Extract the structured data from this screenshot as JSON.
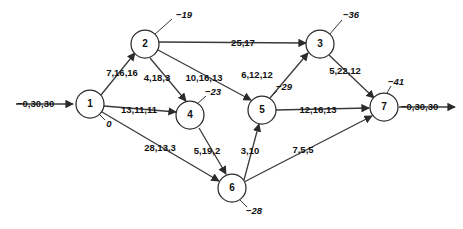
{
  "diagram": {
    "type": "network-flow-graph",
    "colors": {
      "stroke": "#3a3a3a",
      "node_stroke": "#2b2b2b",
      "text": "#111111",
      "background": "#ffffff"
    },
    "nodes": [
      {
        "id": "1",
        "label": "1",
        "supply": "0",
        "cx": 90,
        "cy": 104,
        "r": 14,
        "supply_x": 109,
        "supply_y": 124,
        "leader": [
          99,
          114,
          105,
          120
        ]
      },
      {
        "id": "2",
        "label": "2",
        "supply": "−19",
        "cx": 145,
        "cy": 44,
        "r": 14,
        "supply_x": 184,
        "supply_y": 15,
        "leader": [
          154,
          35,
          172,
          19
        ]
      },
      {
        "id": "3",
        "label": "3",
        "supply": "−36",
        "cx": 320,
        "cy": 44,
        "r": 14,
        "supply_x": 351,
        "supply_y": 15,
        "leader": [
          329,
          35,
          342,
          20
        ]
      },
      {
        "id": "4",
        "label": "4",
        "supply": "−23",
        "cx": 190,
        "cy": 115,
        "r": 14,
        "supply_x": 213,
        "supply_y": 92,
        "leader": [
          197,
          104,
          206,
          96
        ]
      },
      {
        "id": "5",
        "label": "5",
        "supply": "−29",
        "cx": 262,
        "cy": 110,
        "r": 14,
        "supply_x": 284,
        "supply_y": 87,
        "leader": [
          269,
          99,
          277,
          91
        ]
      },
      {
        "id": "6",
        "label": "6",
        "supply": "−28",
        "cx": 232,
        "cy": 188,
        "r": 14,
        "supply_x": 254,
        "supply_y": 211,
        "leader": [
          239,
          199,
          247,
          207
        ]
      },
      {
        "id": "7",
        "label": "7",
        "supply": "−41",
        "cx": 384,
        "cy": 107,
        "r": 14,
        "supply_x": 396,
        "supply_y": 82,
        "leader": [
          387,
          93,
          391,
          86
        ]
      }
    ],
    "edges": [
      {
        "from": "1",
        "to": "2",
        "label": "7,16,16",
        "lx": 122,
        "ly": 73,
        "x1": 101,
        "y1": 95,
        "x2": 135,
        "y2": 53
      },
      {
        "from": "1",
        "to": "4",
        "label": "13,11,11",
        "lx": 139,
        "ly": 110,
        "x1": 104,
        "y1": 106,
        "x2": 176,
        "y2": 112
      },
      {
        "from": "1",
        "to": "6",
        "label": "28,13,3",
        "lx": 160,
        "ly": 148,
        "x1": 102,
        "y1": 112,
        "x2": 219,
        "y2": 181
      },
      {
        "from": "2",
        "to": "3",
        "label": "25,17",
        "lx": 243,
        "ly": 43,
        "x1": 159,
        "y1": 42,
        "x2": 306,
        "y2": 43
      },
      {
        "from": "2",
        "to": "4",
        "label": "4,18,3",
        "lx": 157,
        "ly": 78,
        "x1": 150,
        "y1": 58,
        "x2": 186,
        "y2": 101
      },
      {
        "from": "2",
        "to": "5",
        "label": "10,16,13",
        "lx": 204,
        "ly": 78,
        "x1": 158,
        "y1": 50,
        "x2": 251,
        "y2": 100
      },
      {
        "from": "5",
        "to": "3",
        "label": "6,12,12",
        "lx": 257,
        "ly": 75,
        "x1": 270,
        "y1": 98,
        "x2": 308,
        "y2": 53
      },
      {
        "from": "3",
        "to": "7",
        "label": "5,22,12",
        "lx": 345,
        "ly": 71,
        "x1": 329,
        "y1": 55,
        "x2": 374,
        "y2": 98
      },
      {
        "from": "5",
        "to": "7",
        "label": "12,16,13",
        "lx": 318,
        "ly": 110,
        "x1": 276,
        "y1": 110,
        "x2": 369,
        "y2": 108
      },
      {
        "from": "4",
        "to": "6",
        "label": "5,19,2",
        "lx": 207,
        "ly": 151,
        "x1": 199,
        "y1": 128,
        "x2": 226,
        "y2": 174
      },
      {
        "from": "6",
        "to": "5",
        "label": "3,10",
        "lx": 250,
        "ly": 151,
        "x1": 244,
        "y1": 180,
        "x2": 259,
        "y2": 124
      },
      {
        "from": "6",
        "to": "7",
        "label": "7,5,5",
        "lx": 303,
        "ly": 150,
        "x1": 244,
        "y1": 182,
        "x2": 372,
        "y2": 116
      }
    ],
    "terminals": [
      {
        "name": "source-inflow",
        "label": "−0,30,30",
        "lx": 17,
        "ly": 104,
        "x1": 16,
        "y1": 104,
        "x2": 73,
        "y2": 104
      },
      {
        "name": "sink-outflow",
        "label": "−0,30,30",
        "lx": 401,
        "ly": 107,
        "x1": 399,
        "y1": 107,
        "x2": 455,
        "y2": 107
      }
    ]
  }
}
